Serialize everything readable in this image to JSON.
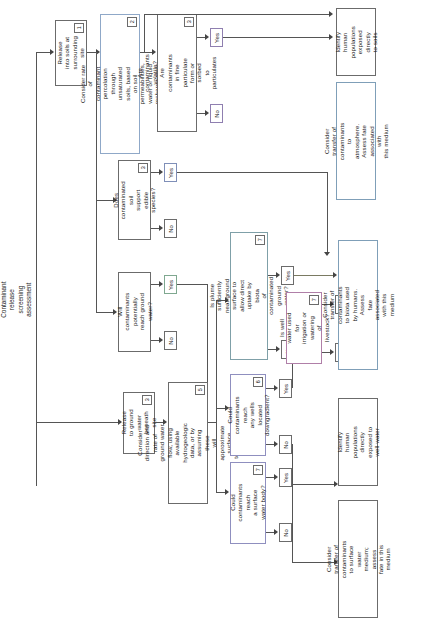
{
  "diagram": {
    "title": "Contaminant release\nscreening assessment",
    "orientation": "rotated-90",
    "type": "flowchart",
    "line_color": "#555555",
    "box_border_color": "#6b6b6b",
    "text_color": "#1a1a1a"
  },
  "nodes": {
    "release_soils": {
      "label": "Release into soils at\nsurrounding site",
      "marker": "1"
    },
    "percolation": {
      "label": "Consider rate of contaminant\npercolation through unsaturated\nsoils, based on soil permeabilities,\nwater or liquid recharge rates",
      "marker": "2"
    },
    "volatile": {
      "label": "Are contaminants volatile?\nAre contaminants in fine\nparticulate form or sorbed\nto particulates",
      "marker": "3"
    },
    "edible_species": {
      "label": "Does contaminated soil\nsupport edible species?",
      "marker": "3"
    },
    "reach_gw": {
      "label": "Will contaminants potentially\nreach ground water?",
      "marker": ""
    },
    "release_gw": {
      "label": "Release to ground water\nbeneath site",
      "marker": "3"
    },
    "gw_flow": {
      "label": "Consider direction and rate of\nground water flow, using available\nhydrogeologic data, or by assuming these\nwill approximate surface topography",
      "marker": "5"
    },
    "plume_near": {
      "label": "Is plume sufficiently near ground\nsurface to allow direct uptake by biota\nof contaminated ground water?",
      "marker": "7"
    },
    "wells_downgrad": {
      "label": "Could contaminants reach\nany wells located\ndowngradient?",
      "marker": "6"
    },
    "well_water_use": {
      "label": "Is well water used for\nirrigation or watering\nof livestock?",
      "marker": "7"
    },
    "surface_water": {
      "label": "Could contaminants reach\na surface water body?",
      "marker": "7"
    },
    "out_soils": {
      "label": "Identify human\npopulations\nexposed directly\nto soils",
      "marker": ""
    },
    "out_atmosphere": {
      "label": "Consider transfer of\ncontaminants to atmosphere.\nAssess fate associated with\nthis medium",
      "marker": ""
    },
    "out_biota": {
      "label": "Consider transfer of contaminants\nto biota used by humans. Assess\nfate associated with this medium",
      "marker": ""
    },
    "out_wellwater": {
      "label": "Identify human\npopulations directly\nexposed to well water",
      "marker": ""
    },
    "out_surfacewater": {
      "label": "Consider transfer of contaminants\nto surface water medium; assess\nfate in this medium",
      "marker": ""
    }
  },
  "branch_labels": {
    "volatile_yes": "Yes",
    "volatile_no": "No",
    "edible_yes": "Yes",
    "edible_no": "No",
    "reach_gw_yes": "Yes",
    "reach_gw_no": "No",
    "plume_yes": "Yes",
    "plume_no": "No",
    "wells_yes": "Yes",
    "wells_no": "No",
    "wellwater_yes": "Yes",
    "wellwater_no": "No",
    "surface_yes": "Yes",
    "surface_no": "No"
  }
}
